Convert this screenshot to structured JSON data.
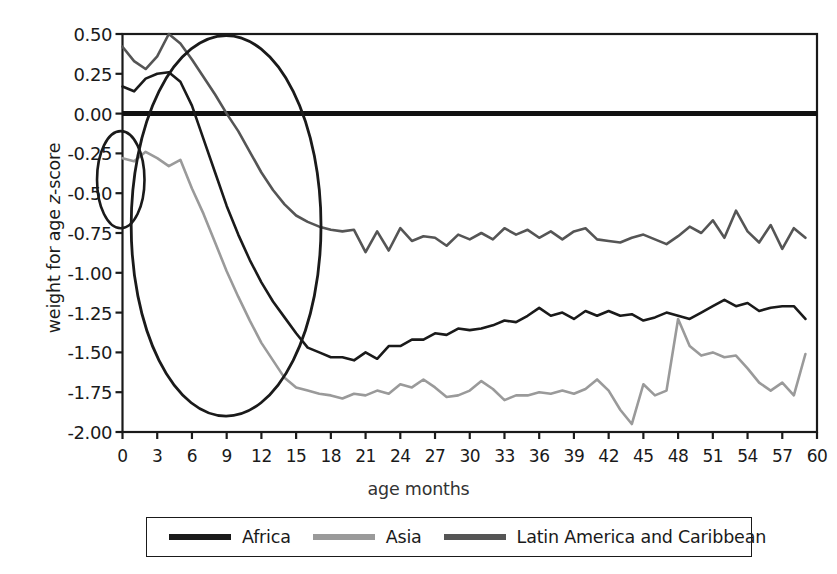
{
  "chart_data": {
    "type": "line",
    "title": "",
    "xlabel": "age months",
    "ylabel": "weight for age z-score",
    "xlim": [
      0,
      60
    ],
    "ylim": [
      -2.0,
      0.5
    ],
    "yticks": [
      "0.50",
      "0.25",
      "0.00",
      "-0.25",
      "-0.50",
      "-0.75",
      "-1.00",
      "-1.25",
      "-1.50",
      "-1.75",
      "-2.00"
    ],
    "ytick_values": [
      0.5,
      0.25,
      0.0,
      -0.25,
      -0.5,
      -0.75,
      -1.0,
      -1.25,
      -1.5,
      -1.75,
      -2.0
    ],
    "xticks": [
      "0",
      "3",
      "6",
      "9",
      "12",
      "15",
      "18",
      "21",
      "24",
      "27",
      "30",
      "33",
      "36",
      "39",
      "42",
      "45",
      "48",
      "51",
      "54",
      "57",
      "60"
    ],
    "xtick_values": [
      0,
      3,
      6,
      9,
      12,
      15,
      18,
      21,
      24,
      27,
      30,
      33,
      36,
      39,
      42,
      45,
      48,
      51,
      54,
      57,
      60
    ],
    "grid": false,
    "legend_position": "bottom",
    "reference_line": {
      "value": 0.0,
      "color": "#111111",
      "width": 5
    },
    "x": [
      0,
      1,
      2,
      3,
      4,
      5,
      6,
      7,
      8,
      9,
      10,
      11,
      12,
      13,
      14,
      15,
      16,
      17,
      18,
      19,
      20,
      21,
      22,
      23,
      24,
      25,
      26,
      27,
      28,
      29,
      30,
      31,
      32,
      33,
      34,
      35,
      36,
      37,
      38,
      39,
      40,
      41,
      42,
      43,
      44,
      45,
      46,
      47,
      48,
      49,
      50,
      51,
      52,
      53,
      54,
      55,
      56,
      57,
      58,
      59
    ],
    "series": [
      {
        "name": "Africa",
        "color": "#1a1a1a",
        "width": 2.6,
        "values": [
          0.17,
          0.14,
          0.22,
          0.25,
          0.26,
          0.2,
          0.05,
          -0.16,
          -0.37,
          -0.58,
          -0.76,
          -0.92,
          -1.06,
          -1.18,
          -1.28,
          -1.38,
          -1.47,
          -1.5,
          -1.53,
          -1.53,
          -1.55,
          -1.5,
          -1.54,
          -1.46,
          -1.46,
          -1.42,
          -1.42,
          -1.38,
          -1.39,
          -1.35,
          -1.36,
          -1.35,
          -1.33,
          -1.3,
          -1.31,
          -1.27,
          -1.22,
          -1.27,
          -1.25,
          -1.29,
          -1.24,
          -1.27,
          -1.24,
          -1.27,
          -1.26,
          -1.3,
          -1.28,
          -1.25,
          -1.27,
          -1.29,
          -1.25,
          -1.21,
          -1.17,
          -1.21,
          -1.19,
          -1.24,
          -1.22,
          -1.21,
          -1.21,
          -1.29
        ]
      },
      {
        "name": "Asia",
        "color": "#9a9a9a",
        "width": 2.6,
        "values": [
          -0.28,
          -0.3,
          -0.24,
          -0.28,
          -0.33,
          -0.29,
          -0.47,
          -0.63,
          -0.81,
          -0.99,
          -1.15,
          -1.3,
          -1.44,
          -1.55,
          -1.66,
          -1.72,
          -1.74,
          -1.76,
          -1.77,
          -1.79,
          -1.76,
          -1.77,
          -1.74,
          -1.76,
          -1.7,
          -1.72,
          -1.67,
          -1.72,
          -1.78,
          -1.77,
          -1.74,
          -1.68,
          -1.73,
          -1.8,
          -1.77,
          -1.77,
          -1.75,
          -1.76,
          -1.74,
          -1.76,
          -1.73,
          -1.67,
          -1.74,
          -1.86,
          -1.95,
          -1.7,
          -1.77,
          -1.74,
          -1.29,
          -1.46,
          -1.52,
          -1.5,
          -1.53,
          -1.52,
          -1.6,
          -1.69,
          -1.74,
          -1.69,
          -1.77,
          -1.51
        ]
      },
      {
        "name": "Latin America and Caribbean",
        "color": "#555555",
        "width": 2.6,
        "values": [
          0.42,
          0.33,
          0.28,
          0.36,
          0.5,
          0.44,
          0.34,
          0.23,
          0.12,
          0.0,
          -0.11,
          -0.24,
          -0.37,
          -0.48,
          -0.57,
          -0.64,
          -0.68,
          -0.71,
          -0.73,
          -0.74,
          -0.73,
          -0.87,
          -0.74,
          -0.86,
          -0.72,
          -0.8,
          -0.77,
          -0.78,
          -0.83,
          -0.76,
          -0.79,
          -0.75,
          -0.79,
          -0.72,
          -0.76,
          -0.73,
          -0.78,
          -0.74,
          -0.79,
          -0.74,
          -0.72,
          -0.79,
          -0.8,
          -0.81,
          -0.78,
          -0.76,
          -0.79,
          -0.82,
          -0.77,
          -0.71,
          -0.75,
          -0.67,
          -0.78,
          -0.61,
          -0.74,
          -0.81,
          -0.7,
          -0.85,
          -0.72,
          -0.78
        ]
      }
    ],
    "annotations": [
      {
        "kind": "ellipse",
        "name": "birth-deficit-ellipse",
        "cx_month": -0.15,
        "cy_value": -0.415,
        "rx_months": 2.05,
        "ry_value": 0.305,
        "color": "#1a1a1a",
        "width": 2.6
      },
      {
        "kind": "ellipse",
        "name": "growth-faltering-ellipse",
        "cx_month": 8.95,
        "cy_value": -0.705,
        "rx_months": 8.2,
        "ry_value": 1.195,
        "color": "#1a1a1a",
        "width": 2.8
      }
    ]
  },
  "legend": {
    "items": [
      {
        "label": "Africa",
        "color": "#1a1a1a"
      },
      {
        "label": "Asia",
        "color": "#9a9a9a"
      },
      {
        "label": "Latin America and Caribbean",
        "color": "#555555"
      }
    ]
  },
  "axes": {
    "frame_color": "#1a1a1a"
  }
}
